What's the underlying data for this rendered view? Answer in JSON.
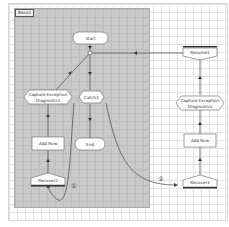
{
  "canvas": {
    "block_label": "Block1",
    "colors": {
      "background": "#ffffff",
      "block_fill": "#c9c9c9",
      "node_fill": "#ffffff",
      "node_stroke": "#666666",
      "connector": "#555555"
    }
  },
  "nodes": {
    "start": {
      "label": "Start",
      "shape": "rounded"
    },
    "catch1": {
      "label": "Catch1",
      "shape": "hexagon"
    },
    "end": {
      "label": "End",
      "shape": "rounded"
    },
    "capture_left": {
      "label_line1": "Capture Exception",
      "label_line2": "Diagnostics",
      "shape": "hexagon"
    },
    "add_row_left": {
      "label": "Add Row",
      "shape": "rectangle"
    },
    "recover2": {
      "label": "Recover2",
      "shape": "recover"
    },
    "resume1": {
      "label": "Resume1",
      "shape": "resume"
    },
    "capture_right": {
      "label_line1": "Capture Exception",
      "label_line2": "Diagnostics",
      "shape": "hexagon"
    },
    "add_row_right": {
      "label": "Add Row",
      "shape": "rectangle"
    },
    "recover1": {
      "label": "Recover1",
      "shape": "recover"
    }
  },
  "annotations": {
    "marker1": "①",
    "marker2": "②"
  }
}
